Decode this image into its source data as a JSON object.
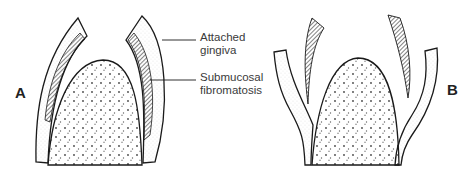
{
  "figure": {
    "panels": [
      {
        "id": "A",
        "label": "A"
      },
      {
        "id": "B",
        "label": "B"
      }
    ],
    "callouts": [
      {
        "id": "attached-gingiva",
        "line1": "Attached",
        "line2": "gingiva"
      },
      {
        "id": "submucosal-fibromatosis",
        "line1": "Submucosal",
        "line2": "fibromatosis"
      }
    ],
    "colors": {
      "stroke": "#1a1a1a",
      "background": "#ffffff",
      "text": "#333333"
    }
  }
}
